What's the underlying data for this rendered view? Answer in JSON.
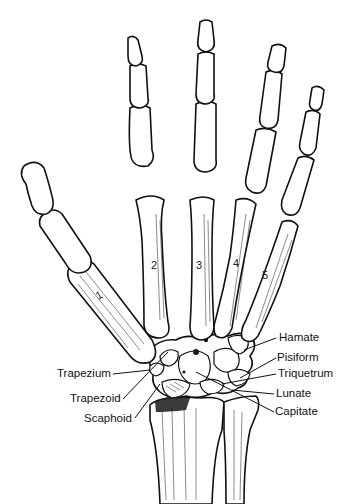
{
  "figure": {
    "metacarpal_numbers": [
      "1",
      "2",
      "3",
      "4",
      "5"
    ],
    "labels_left": [
      {
        "id": "trapezium",
        "text": "Trapezium"
      },
      {
        "id": "trapezoid",
        "text": "Trapezoid"
      },
      {
        "id": "scaphoid",
        "text": "Scaphoid"
      }
    ],
    "labels_right": [
      {
        "id": "hamate",
        "text": "Hamate"
      },
      {
        "id": "pisiform",
        "text": "Pisiform"
      },
      {
        "id": "triquetrum",
        "text": "Triquetrum"
      },
      {
        "id": "lunate",
        "text": "Lunate"
      },
      {
        "id": "capitate",
        "text": "Capitate"
      }
    ],
    "colors": {
      "background": "#ffffff",
      "ink": "#111111"
    }
  }
}
